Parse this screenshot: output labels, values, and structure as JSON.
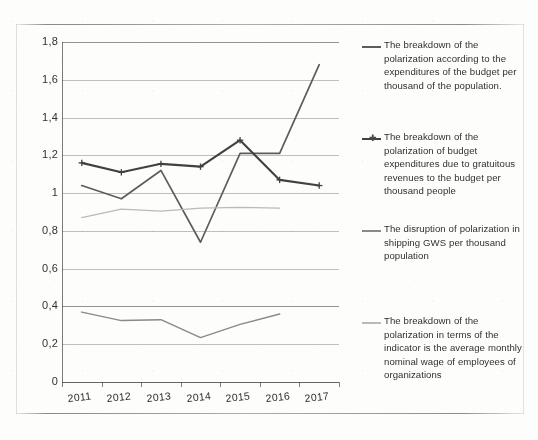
{
  "chart_data": {
    "type": "line",
    "title": "",
    "xlabel": "",
    "ylabel": "",
    "categories": [
      "2011",
      "2012",
      "2013",
      "2014",
      "2015",
      "2016",
      "2017"
    ],
    "ylim": [
      0,
      1.8
    ],
    "yticks": [
      "0",
      "0,2",
      "0,4",
      "0,6",
      "0,8",
      "1",
      "1,2",
      "1,4",
      "1,6",
      "1,8"
    ],
    "ytick_values": [
      0,
      0.2,
      0.4,
      0.6,
      0.8,
      1.0,
      1.2,
      1.4,
      1.6,
      1.8
    ],
    "grid": true,
    "legend_position": "right",
    "decimal_separator": ",",
    "series": [
      {
        "name": "The breakdown of the polarization according to the expenditures of the budget per thousand of the population.",
        "color": "#5c5c5c",
        "marker": "none",
        "values": [
          1.04,
          0.97,
          1.12,
          0.74,
          1.21,
          1.21,
          1.68
        ]
      },
      {
        "name": "The breakdown of the polarization of budget expenditures due to gratuitous revenues to the budget per thousand people",
        "color": "#3f3f3f",
        "marker": "cross",
        "values": [
          1.16,
          1.11,
          1.155,
          1.14,
          1.28,
          1.07,
          1.04
        ]
      },
      {
        "name": "The disruption of polarization in shipping GWS per thousand population",
        "color": "#8a8a8a",
        "marker": "none",
        "values": [
          0.37,
          0.325,
          0.33,
          0.235,
          0.305,
          0.36,
          null
        ]
      },
      {
        "name": "The breakdown of the polarization in terms of the indicator is the average monthly nominal wage of employees of organizations",
        "color": "#bcbcbc",
        "marker": "none",
        "values": [
          0.87,
          0.915,
          0.905,
          0.92,
          0.925,
          0.92,
          null
        ]
      }
    ]
  },
  "legend": {
    "items": [
      {
        "label": "The breakdown of the polarization according to the expenditures of the budget per thousand of the population.",
        "swatch": "line-plain",
        "color": "#5c5c5c"
      },
      {
        "label": "The breakdown of the polarization of budget expenditures due to gratuitous revenues to the budget per thousand people",
        "swatch": "line-cross-marker",
        "color": "#3f3f3f"
      },
      {
        "label": "The disruption of polarization in shipping GWS per thousand population",
        "swatch": "line-plain",
        "color": "#8a8a8a"
      },
      {
        "label": "The breakdown of the polarization in terms of the indicator is the average monthly nominal wage of employees of organizations",
        "swatch": "line-plain",
        "color": "#bcbcbc"
      }
    ]
  },
  "axis": {
    "y_labels": [
      "1,8",
      "1,6",
      "1,4",
      "1,2",
      "1",
      "0,8",
      "0,6",
      "0,4",
      "0,2",
      "0"
    ],
    "x_labels": [
      "2011",
      "2012",
      "2013",
      "2014",
      "2015",
      "2016",
      "2017"
    ]
  }
}
